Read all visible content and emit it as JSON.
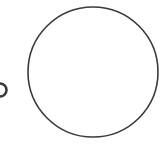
{
  "diagram": {
    "background": "#ffffff",
    "stroke_color": "#3a3a3a",
    "shapes": [
      {
        "name": "large-circle",
        "cx": 93,
        "cy": 72,
        "r": 65,
        "stroke_width": 1.6
      },
      {
        "name": "small-partial-circle",
        "cx": 0,
        "cy": 90,
        "r": 6.5,
        "stroke_width": 2.6
      }
    ]
  }
}
